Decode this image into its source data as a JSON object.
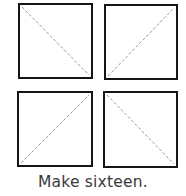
{
  "squares": [
    {
      "position": "top-left",
      "diagonal": "top-left-to-bottom-right"
    },
    {
      "position": "top-right",
      "diagonal": "bottom-left-to-top-right"
    },
    {
      "position": "bottom-left",
      "diagonal": "bottom-left-to-top-right"
    },
    {
      "position": "bottom-right",
      "diagonal": "top-left-to-bottom-right"
    }
  ],
  "colors": {
    "border": "#151515",
    "diagonal": "#9a9a9a",
    "text": "#3a3a3a"
  },
  "caption": "Make sixteen."
}
